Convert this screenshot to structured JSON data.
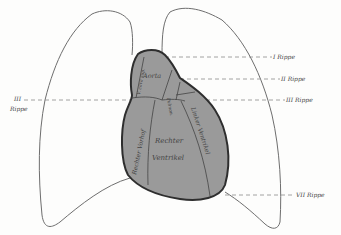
{
  "diagram": {
    "type": "anatomical-illustration",
    "regions": {
      "aorta": "Aorta",
      "vena_cava": "V. cava sup.",
      "pulmonalis": "Pulmon.",
      "left_atrium": "",
      "right_atrium": "Rechter Vorhof",
      "right_ventricle_line1": "Rechter",
      "right_ventricle_line2": "Ventrikel",
      "left_ventricle": "Linker Ventrikel"
    },
    "rib_labels": {
      "rib1": "I Rippe",
      "rib2": "II Rippe",
      "rib3_right": "III Rippe",
      "rib3_left_line1": "III",
      "rib3_left_line2": "Rippe",
      "rib7": "VII Rippe"
    },
    "colors": {
      "heart_fill": "#9a9a9a",
      "heart_outline": "#2e2e2e",
      "lung_outline": "#6e6e6e",
      "dashed_line": "#8a8a8a",
      "background": "#fdfdfc"
    }
  }
}
